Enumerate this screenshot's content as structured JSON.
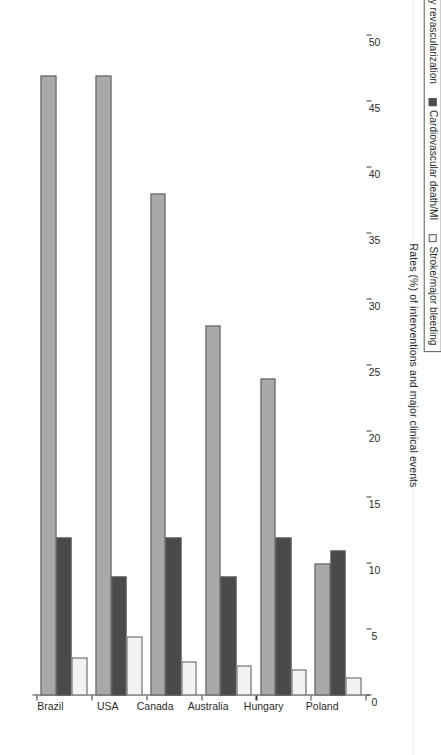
{
  "figure": {
    "orientation": "rotated-90-ccw",
    "background": "#ffffff"
  },
  "axis": {
    "value_axis_title": "Rates (%) of interventions and major clinical events",
    "value_ticks": [
      "50",
      "45",
      "40",
      "35",
      "30",
      "25",
      "20",
      "15",
      "10",
      "5",
      "0"
    ],
    "category_labels": [
      "Brazil",
      "USA",
      "Canada",
      "Australia",
      "Hungary",
      "Poland"
    ]
  },
  "legend": {
    "items": [
      {
        "label": "Any revascularization",
        "color": "#a9a9a9"
      },
      {
        "label": "Cardiovascular death/MI",
        "color": "#4a4a4a"
      },
      {
        "label": "Stroke/major bleeding",
        "color": "#f2f2f2"
      }
    ]
  },
  "chart_data": {
    "type": "bar",
    "title": "",
    "xlabel": "",
    "ylabel": "Rates (%) of interventions and major clinical events",
    "ylim": [
      0,
      50
    ],
    "ytick_step": 5,
    "grid": false,
    "legend_position": "bottom-right",
    "orientation": "vertical-grouped",
    "categories": [
      "Brazil",
      "USA",
      "Canada",
      "Australia",
      "Hungary",
      "Poland"
    ],
    "series": [
      {
        "name": "Any revascularization",
        "color": "#a9a9a9",
        "values": [
          47.0,
          47.0,
          38.0,
          28.0,
          24.0,
          10.0
        ]
      },
      {
        "name": "Cardiovascular death/MI",
        "color": "#4a4a4a",
        "values": [
          12.0,
          9.0,
          12.0,
          9.0,
          12.0,
          11.0
        ]
      },
      {
        "name": "Stroke/major bleeding",
        "color": "#f2f2f2",
        "values": [
          2.9,
          4.5,
          2.6,
          2.3,
          2.0,
          1.4
        ]
      }
    ]
  }
}
